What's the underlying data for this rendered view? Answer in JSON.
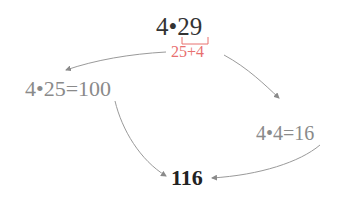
{
  "diagram": {
    "top_expression": "4•29",
    "split_label": "25+4",
    "left_product": "4•25=100",
    "right_product": "4•4=16",
    "result": "116"
  },
  "colors": {
    "split": "#e8706f",
    "arrows": "#9a9a9a",
    "partials": "#8a8a8a",
    "result": "#222222"
  }
}
